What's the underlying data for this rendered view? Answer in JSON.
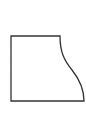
{
  "figure": {
    "stroke_color": "#333333",
    "fill_color": "#ffffff",
    "background_color": "#ffffff",
    "stroke_width": 1.3,
    "shape": {
      "top_left": [
        11,
        36
      ],
      "top_right": [
        60,
        36
      ],
      "bottom_right": [
        84,
        101
      ],
      "bottom_left": [
        11,
        101
      ],
      "curve_path": "M60,36 C60,52 64,60 72,70 C80,80 84,90 84,101"
    }
  }
}
